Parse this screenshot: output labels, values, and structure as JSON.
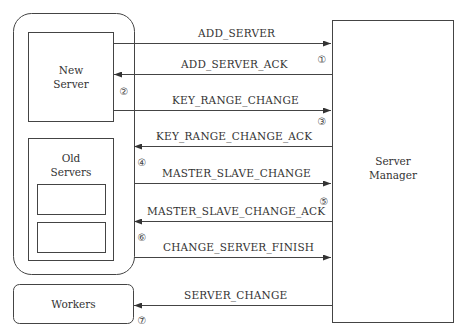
{
  "components": {
    "new_server": {
      "label_line1": "New",
      "label_line2": "Server"
    },
    "old_servers": {
      "label_line1": "Old",
      "label_line2": "Servers"
    },
    "server_manager": {
      "label_line1": "Server",
      "label_line2": "Manager"
    },
    "workers": {
      "label": "Workers"
    }
  },
  "messages": [
    {
      "label": "ADD_SERVER",
      "direction": "right",
      "from": "New Server",
      "to": "Server Manager"
    },
    {
      "label": "ADD_SERVER_ACK",
      "direction": "left",
      "from": "Server Manager",
      "to": "New Server"
    },
    {
      "label": "KEY_RANGE_CHANGE",
      "direction": "right",
      "from": "New Server",
      "to": "Server Manager"
    },
    {
      "label": "KEY_RANGE_CHANGE_ACK",
      "direction": "left",
      "from": "Server Manager",
      "to": "Old Servers"
    },
    {
      "label": "MASTER_SLAVE_CHANGE",
      "direction": "right",
      "from": "Old Servers",
      "to": "Server Manager"
    },
    {
      "label": "MASTER_SLAVE_CHANGE_ACK",
      "direction": "left",
      "from": "Server Manager",
      "to": "Old Servers"
    },
    {
      "label": "CHANGE_SERVER_FINISH",
      "direction": "right",
      "from": "Old Servers",
      "to": "Server Manager"
    },
    {
      "label": "SERVER_CHANGE",
      "direction": "left",
      "from": "Server Manager",
      "to": "Workers"
    }
  ],
  "steps": [
    "①",
    "②",
    "③",
    "④",
    "⑤",
    "⑥",
    "⑦"
  ],
  "colors": {
    "line": "#444444",
    "text": "#333333",
    "background": "#ffffff"
  }
}
